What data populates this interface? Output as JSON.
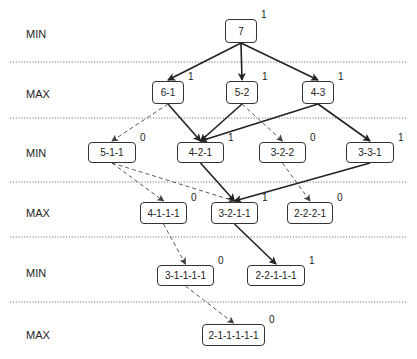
{
  "levels": [
    {
      "label": "MIN",
      "y": 34
    },
    {
      "label": "MAX",
      "y": 94
    },
    {
      "label": "MIN",
      "y": 153
    },
    {
      "label": "MAX",
      "y": 213
    },
    {
      "label": "MIN",
      "y": 273
    },
    {
      "label": "MAX",
      "y": 335
    }
  ],
  "separators_y": [
    62,
    118,
    182,
    237,
    302
  ],
  "nodes": [
    {
      "id": "7",
      "label": "7",
      "value": "1",
      "x": 225,
      "y": 19,
      "w": 32,
      "h": 24
    },
    {
      "id": "6-1",
      "label": "6-1",
      "value": "1",
      "x": 152,
      "y": 81,
      "w": 32,
      "h": 23
    },
    {
      "id": "5-2",
      "label": "5-2",
      "value": "1",
      "x": 226,
      "y": 81,
      "w": 32,
      "h": 23
    },
    {
      "id": "4-3",
      "label": "4-3",
      "value": "1",
      "x": 302,
      "y": 81,
      "w": 32,
      "h": 23
    },
    {
      "id": "5-1-1",
      "label": "5-1-1",
      "value": "0",
      "x": 88,
      "y": 142,
      "w": 48,
      "h": 21
    },
    {
      "id": "4-2-1",
      "label": "4-2-1",
      "value": "1",
      "x": 177,
      "y": 142,
      "w": 47,
      "h": 21
    },
    {
      "id": "3-2-2",
      "label": "3-2-2",
      "value": "0",
      "x": 259,
      "y": 142,
      "w": 47,
      "h": 21
    },
    {
      "id": "3-3-1",
      "label": "3-3-1",
      "value": "1",
      "x": 346,
      "y": 142,
      "w": 48,
      "h": 21
    },
    {
      "id": "4-1-1-1",
      "label": "4-1-1-1",
      "value": "0",
      "x": 140,
      "y": 202,
      "w": 47,
      "h": 22
    },
    {
      "id": "3-2-1-1",
      "label": "3-2-1-1",
      "value": "1",
      "x": 211,
      "y": 202,
      "w": 47,
      "h": 22
    },
    {
      "id": "2-2-2-1",
      "label": "2-2-2-1",
      "value": "0",
      "x": 287,
      "y": 202,
      "w": 46,
      "h": 22
    },
    {
      "id": "3-1-1-1-1",
      "label": "3-1-1-1-1",
      "value": "0",
      "x": 157,
      "y": 265,
      "w": 57,
      "h": 21
    },
    {
      "id": "2-2-1-1-1",
      "label": "2-2-1-1-1",
      "value": "1",
      "x": 247,
      "y": 265,
      "w": 58,
      "h": 21
    },
    {
      "id": "2-1-1-1-1-1",
      "label": "2-1-1-1-1-1",
      "value": "0",
      "x": 202,
      "y": 324,
      "w": 63,
      "h": 22
    }
  ],
  "edges": [
    {
      "from": "7",
      "to": "6-1",
      "style": "solid"
    },
    {
      "from": "7",
      "to": "5-2",
      "style": "solid"
    },
    {
      "from": "7",
      "to": "4-3",
      "style": "solid"
    },
    {
      "from": "6-1",
      "to": "5-1-1",
      "style": "dashed"
    },
    {
      "from": "6-1",
      "to": "4-2-1",
      "style": "solid"
    },
    {
      "from": "5-2",
      "to": "4-2-1",
      "style": "solid"
    },
    {
      "from": "5-2",
      "to": "3-2-2",
      "style": "dashed"
    },
    {
      "from": "4-3",
      "to": "4-2-1",
      "style": "solid"
    },
    {
      "from": "4-3",
      "to": "3-3-1",
      "style": "solid"
    },
    {
      "from": "5-1-1",
      "to": "4-1-1-1",
      "style": "dashed"
    },
    {
      "from": "5-1-1",
      "to": "3-2-1-1",
      "style": "dashed"
    },
    {
      "from": "4-2-1",
      "to": "3-2-1-1",
      "style": "solid"
    },
    {
      "from": "3-3-1",
      "to": "3-2-1-1",
      "style": "solid"
    },
    {
      "from": "3-2-2",
      "to": "2-2-2-1",
      "style": "dashed"
    },
    {
      "from": "4-1-1-1",
      "to": "3-1-1-1-1",
      "style": "dashed"
    },
    {
      "from": "3-2-1-1",
      "to": "2-2-1-1-1",
      "style": "solid"
    },
    {
      "from": "3-1-1-1-1",
      "to": "2-1-1-1-1-1",
      "style": "dashed"
    }
  ],
  "colors": {
    "line": "#222222",
    "dashed": "#444444",
    "separator": "#555555"
  }
}
